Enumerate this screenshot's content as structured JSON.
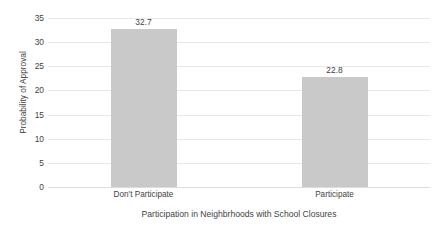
{
  "chart_data": {
    "type": "bar",
    "title": "",
    "categories": [
      "Don't Participate",
      "Participate"
    ],
    "values": [
      32.7,
      22.8
    ],
    "data_labels": [
      "32.7",
      "22.8"
    ],
    "xlabel": "Participation in Neighbrhoods with School Closures",
    "ylabel": "Probability of Approval",
    "ylim": [
      0,
      35
    ],
    "ytick_values": [
      0,
      5,
      10,
      15,
      20,
      25,
      30,
      35
    ],
    "ytick_labels": [
      "0",
      "5",
      "10",
      "15",
      "20",
      "25",
      "30",
      "35"
    ],
    "grid": "horizontal",
    "legend": "none",
    "bar_color": "#c9c9c9",
    "gridline_color": "#e8e8e8",
    "text_color": "#3f3f3f",
    "background_color": "#ffffff"
  }
}
